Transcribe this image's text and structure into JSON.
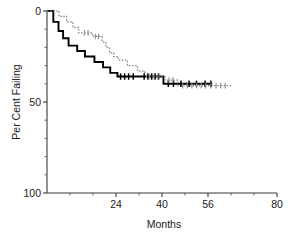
{
  "chart_data": {
    "type": "line",
    "title": "",
    "subtitle": "",
    "xlabel": "Months",
    "ylabel": "Per Cent Failing",
    "xlim": [
      0,
      80
    ],
    "ylim": [
      0,
      100
    ],
    "y_axis_inverted": true,
    "grid": false,
    "legend_position": "none",
    "x_ticks_major": [
      24,
      40,
      56,
      80
    ],
    "x_tick_labels": [
      "24",
      "40",
      "56",
      "80"
    ],
    "x_ticks_minor": [
      8,
      16,
      32,
      48,
      64,
      72
    ],
    "y_ticks_major": [
      0,
      50,
      100
    ],
    "y_tick_labels": [
      "0",
      "50",
      "100"
    ],
    "y_ticks_minor": [
      10,
      20,
      30,
      40,
      60,
      70,
      80,
      90
    ],
    "series": [
      {
        "name": "solid-curve",
        "style": "solid",
        "color": "#000000",
        "step": "post",
        "points": [
          [
            0,
            0
          ],
          [
            2.2,
            0
          ],
          [
            2.2,
            6
          ],
          [
            4.0,
            6
          ],
          [
            4.0,
            11
          ],
          [
            5.6,
            11
          ],
          [
            5.6,
            15
          ],
          [
            7.5,
            15
          ],
          [
            7.5,
            19
          ],
          [
            10.5,
            19
          ],
          [
            10.5,
            22
          ],
          [
            13.2,
            22
          ],
          [
            13.2,
            25
          ],
          [
            16.5,
            25
          ],
          [
            16.5,
            28
          ],
          [
            19.5,
            28
          ],
          [
            19.5,
            31
          ],
          [
            22.0,
            31
          ],
          [
            22.0,
            34
          ],
          [
            24.5,
            34
          ],
          [
            24.5,
            36
          ],
          [
            40.5,
            36
          ],
          [
            40.5,
            40
          ],
          [
            57.5,
            40
          ]
        ],
        "censor_marks": [
          [
            25.6,
            36
          ],
          [
            27.0,
            36
          ],
          [
            28.4,
            36
          ],
          [
            30.0,
            36
          ],
          [
            33.8,
            36
          ],
          [
            35.1,
            36
          ],
          [
            36.4,
            36
          ],
          [
            37.6,
            36
          ],
          [
            38.8,
            36
          ],
          [
            42.2,
            40
          ],
          [
            44.0,
            40
          ],
          [
            46.6,
            40
          ],
          [
            49.4,
            40
          ],
          [
            52.0,
            40
          ],
          [
            55.0,
            40
          ],
          [
            57.0,
            40
          ]
        ]
      },
      {
        "name": "dotted-curve",
        "style": "dotted",
        "color": "#8a8a8a",
        "step": "post",
        "points": [
          [
            0,
            0
          ],
          [
            4.2,
            0
          ],
          [
            4.2,
            3
          ],
          [
            6.8,
            3
          ],
          [
            6.8,
            6
          ],
          [
            9.0,
            6
          ],
          [
            9.0,
            9
          ],
          [
            11.0,
            9
          ],
          [
            11.0,
            12
          ],
          [
            15.8,
            12
          ],
          [
            15.8,
            14
          ],
          [
            19.2,
            14
          ],
          [
            19.2,
            17
          ],
          [
            20.5,
            17
          ],
          [
            20.5,
            20
          ],
          [
            21.8,
            20
          ],
          [
            21.8,
            23
          ],
          [
            23.2,
            23
          ],
          [
            23.2,
            25
          ],
          [
            24.8,
            25
          ],
          [
            24.8,
            27
          ],
          [
            28.0,
            27
          ],
          [
            28.0,
            30
          ],
          [
            31.5,
            30
          ],
          [
            31.5,
            33
          ],
          [
            34.0,
            33
          ],
          [
            34.0,
            36
          ],
          [
            41.0,
            36
          ],
          [
            41.0,
            38
          ],
          [
            45.5,
            38
          ],
          [
            45.5,
            41
          ],
          [
            64.0,
            41
          ]
        ],
        "censor_marks": [
          [
            13.0,
            12
          ],
          [
            14.3,
            12
          ],
          [
            16.8,
            14
          ],
          [
            17.9,
            14
          ],
          [
            35.6,
            36
          ],
          [
            37.2,
            36
          ],
          [
            38.6,
            36
          ],
          [
            42.4,
            38
          ],
          [
            43.8,
            38
          ],
          [
            47.2,
            41
          ],
          [
            48.8,
            41
          ],
          [
            50.4,
            41
          ],
          [
            52.0,
            41
          ],
          [
            53.6,
            41
          ],
          [
            55.2,
            41
          ],
          [
            57.0,
            41
          ],
          [
            58.8,
            41
          ],
          [
            60.4,
            41
          ],
          [
            62.0,
            41
          ]
        ]
      }
    ]
  },
  "axes": {
    "x_title": "Months",
    "y_title": "Per Cent Failing"
  }
}
